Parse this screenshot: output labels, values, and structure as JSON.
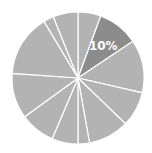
{
  "chart_data": {
    "type": "pie",
    "title": "",
    "start_angle_deg": 0,
    "direction": "clockwise",
    "center": [
      78,
      78
    ],
    "radius": 66,
    "slices": [
      {
        "value": 5.6,
        "label": "",
        "color": "#b3b3b3",
        "highlight": false
      },
      {
        "value": 10.0,
        "label": "10%",
        "color": "#8c8c8c",
        "highlight": true
      },
      {
        "value": 13.0,
        "label": "",
        "color": "#b3b3b3",
        "highlight": false
      },
      {
        "value": 8.6,
        "label": "",
        "color": "#b3b3b3",
        "highlight": false
      },
      {
        "value": 10.0,
        "label": "",
        "color": "#b3b3b3",
        "highlight": false
      },
      {
        "value": 2.8,
        "label": "",
        "color": "#b3b3b3",
        "highlight": false
      },
      {
        "value": 6.4,
        "label": "",
        "color": "#b3b3b3",
        "highlight": false
      },
      {
        "value": 8.6,
        "label": "",
        "color": "#b3b3b3",
        "highlight": false
      },
      {
        "value": 11.1,
        "label": "",
        "color": "#b3b3b3",
        "highlight": false
      },
      {
        "value": 15.3,
        "label": "",
        "color": "#b3b3b3",
        "highlight": false
      },
      {
        "value": 2.5,
        "label": "",
        "color": "#b3b3b3",
        "highlight": false
      },
      {
        "value": 6.1,
        "label": "",
        "color": "#b3b3b3",
        "highlight": false
      }
    ],
    "separator_color": "#ffffff",
    "legend": "none"
  }
}
